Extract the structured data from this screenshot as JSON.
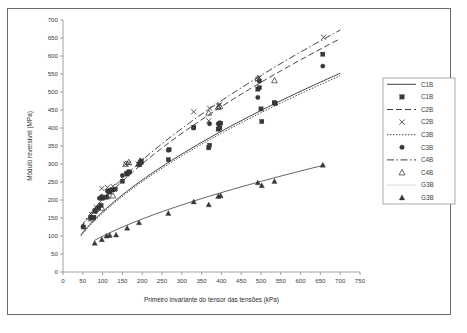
{
  "figure": {
    "border_color": "#6b6b6b",
    "background": "#ffffff"
  },
  "chart_data": {
    "type": "scatter",
    "title": "",
    "xlabel": "Primeiro invariante do tensor das tensões (kPa)",
    "ylabel": "Módulo reversível (MPa)",
    "xlim": [
      0,
      750
    ],
    "ylim": [
      0,
      700
    ],
    "xticks": [
      0,
      50,
      100,
      150,
      200,
      250,
      300,
      350,
      400,
      450,
      500,
      550,
      600,
      650,
      700,
      750
    ],
    "yticks": [
      0,
      50,
      100,
      150,
      200,
      250,
      300,
      350,
      400,
      450,
      500,
      550,
      600,
      650,
      700
    ],
    "grid": false,
    "legend_position": "right",
    "legend": [
      {
        "label": "C1B",
        "kind": "line",
        "style": "solid"
      },
      {
        "label": "C1B",
        "kind": "marker",
        "marker": "square-filled"
      },
      {
        "label": "C2B",
        "kind": "line",
        "style": "dashed"
      },
      {
        "label": "C2B",
        "kind": "marker",
        "marker": "cross-x"
      },
      {
        "label": "C3B",
        "kind": "line",
        "style": "dotted"
      },
      {
        "label": "C3B",
        "kind": "marker",
        "marker": "circle-filled"
      },
      {
        "label": "C4B",
        "kind": "line",
        "style": "dash-dot"
      },
      {
        "label": "C4B",
        "kind": "marker",
        "marker": "triangle-open"
      },
      {
        "label": "G3B",
        "kind": "line",
        "style": "faint-solid"
      },
      {
        "label": "G3B",
        "kind": "marker",
        "marker": "triangle-filled"
      }
    ],
    "series": [
      {
        "name": "C1B",
        "marker": "square-filled",
        "trendline": "solid",
        "points": [
          [
            52,
            125
          ],
          [
            70,
            150
          ],
          [
            78,
            152
          ],
          [
            82,
            168
          ],
          [
            90,
            178
          ],
          [
            96,
            185
          ],
          [
            100,
            205
          ],
          [
            110,
            208
          ],
          [
            118,
            222
          ],
          [
            125,
            228
          ],
          [
            132,
            230
          ],
          [
            150,
            252
          ],
          [
            162,
            272
          ],
          [
            168,
            278
          ],
          [
            192,
            300
          ],
          [
            196,
            305
          ],
          [
            198,
            308
          ],
          [
            266,
            312
          ],
          [
            268,
            340
          ],
          [
            330,
            402
          ],
          [
            368,
            345
          ],
          [
            370,
            352
          ],
          [
            392,
            397
          ],
          [
            396,
            400
          ],
          [
            398,
            413
          ],
          [
            492,
            508
          ],
          [
            496,
            512
          ],
          [
            500,
            453
          ],
          [
            502,
            418
          ],
          [
            534,
            470
          ],
          [
            536,
            468
          ],
          [
            656,
            605
          ]
        ]
      },
      {
        "name": "C2B",
        "marker": "cross-x",
        "trendline": "dashed",
        "points": [
          [
            72,
            160
          ],
          [
            84,
            180
          ],
          [
            98,
            232
          ],
          [
            112,
            235
          ],
          [
            126,
            238
          ],
          [
            158,
            300
          ],
          [
            166,
            302
          ],
          [
            190,
            300
          ],
          [
            196,
            305
          ],
          [
            198,
            310
          ],
          [
            330,
            445
          ],
          [
            368,
            420
          ],
          [
            370,
            455
          ],
          [
            392,
            462
          ],
          [
            396,
            465
          ],
          [
            492,
            535
          ],
          [
            496,
            540
          ],
          [
            658,
            652
          ]
        ]
      },
      {
        "name": "C3B",
        "marker": "circle-filled",
        "trendline": "dotted",
        "points": [
          [
            70,
            152
          ],
          [
            80,
            172
          ],
          [
            92,
            205
          ],
          [
            98,
            210
          ],
          [
            112,
            225
          ],
          [
            120,
            228
          ],
          [
            150,
            268
          ],
          [
            160,
            275
          ],
          [
            166,
            278
          ],
          [
            192,
            298
          ],
          [
            196,
            302
          ],
          [
            266,
            338
          ],
          [
            330,
            400
          ],
          [
            370,
            412
          ],
          [
            392,
            412
          ],
          [
            396,
            415
          ],
          [
            492,
            485
          ],
          [
            496,
            530
          ],
          [
            534,
            470
          ],
          [
            656,
            572
          ]
        ]
      },
      {
        "name": "C4B",
        "marker": "triangle-open",
        "trendline": "dash-dot",
        "points": [
          [
            72,
            148
          ],
          [
            84,
            175
          ],
          [
            98,
            178
          ],
          [
            112,
            210
          ],
          [
            126,
            212
          ],
          [
            158,
            300
          ],
          [
            166,
            305
          ],
          [
            192,
            300
          ],
          [
            196,
            308
          ],
          [
            368,
            442
          ],
          [
            392,
            458
          ],
          [
            396,
            460
          ],
          [
            492,
            538
          ],
          [
            534,
            532
          ]
        ]
      },
      {
        "name": "G3B",
        "marker": "triangle-filled",
        "trendline": "faint-solid",
        "points": [
          [
            80,
            80
          ],
          [
            98,
            90
          ],
          [
            110,
            100
          ],
          [
            118,
            102
          ],
          [
            134,
            103
          ],
          [
            162,
            122
          ],
          [
            192,
            137
          ],
          [
            266,
            163
          ],
          [
            330,
            195
          ],
          [
            368,
            187
          ],
          [
            392,
            210
          ],
          [
            398,
            212
          ],
          [
            492,
            248
          ],
          [
            502,
            240
          ],
          [
            534,
            252
          ],
          [
            656,
            297
          ]
        ]
      }
    ],
    "trendlines": {
      "C1B": {
        "style": "solid",
        "x_start": 45,
        "x_end": 700,
        "y_start": 103,
        "y_end": 552
      },
      "C2B": {
        "style": "dashed",
        "x_start": 45,
        "x_end": 700,
        "y_start": 122,
        "y_end": 648
      },
      "C3B": {
        "style": "dotted",
        "x_start": 45,
        "x_end": 700,
        "y_start": 100,
        "y_end": 545
      },
      "C4B": {
        "style": "dash-dot",
        "x_start": 45,
        "x_end": 700,
        "y_start": 125,
        "y_end": 672
      },
      "G3B": {
        "style": "faint-solid",
        "x_start": 80,
        "x_end": 660,
        "y_start": 88,
        "y_end": 297
      }
    }
  }
}
